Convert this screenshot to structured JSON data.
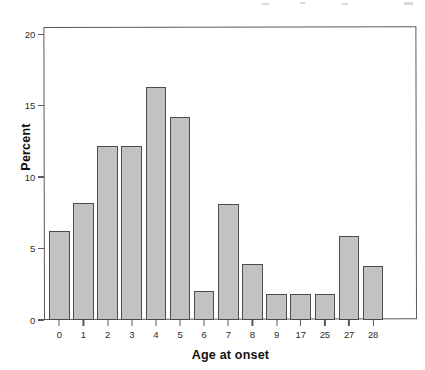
{
  "chart_data": {
    "type": "bar",
    "title": "",
    "subtitle": "",
    "xlabel": "Age at onset",
    "ylabel": "Percent",
    "categories": [
      "0",
      "1",
      "2",
      "3",
      "4",
      "5",
      "6",
      "7",
      "8",
      "9",
      "17",
      "25",
      "27",
      "28"
    ],
    "values": [
      6.2,
      8.2,
      12.2,
      12.2,
      16.3,
      14.2,
      2.0,
      8.1,
      3.9,
      1.8,
      1.8,
      1.8,
      5.9,
      3.8
    ],
    "series": [
      {
        "name": "Percent",
        "values": [
          6.2,
          8.2,
          12.2,
          12.2,
          16.3,
          14.2,
          2.0,
          8.1,
          3.9,
          1.8,
          1.8,
          1.8,
          5.9,
          3.8
        ]
      }
    ],
    "ylim": [
      0,
      20.5
    ],
    "xlim": [
      0,
      14
    ],
    "y_ticks": [
      0,
      5,
      10,
      15,
      20
    ],
    "y_tick_labels": [
      "0",
      "5",
      "10",
      "15",
      "20"
    ],
    "grid": false,
    "legend": false,
    "legend_position": "none",
    "bar_fill_color": "#c2c2c2",
    "bar_edge_color": "#4c4c4c",
    "frame_color": "#5a5a5a",
    "background_color": "#ffffff"
  },
  "axis": {
    "y_title": "Percent",
    "x_title": "Age at onset"
  }
}
